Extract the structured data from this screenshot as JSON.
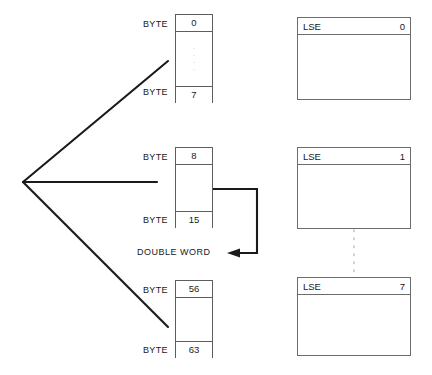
{
  "diagram": {
    "colors": {
      "line": "#1a1a1a",
      "box_border": "#5d5d5d",
      "lse_border": "#6b6b6b",
      "dotted": "#c4c4c4",
      "text": "#1a1a1a",
      "background": "#ffffff"
    },
    "byte_label": "BYTE",
    "lse_label": "LSE",
    "double_word_label": "DOUBLE WORD",
    "vertical_ellipsis": "·",
    "byte_groups": [
      {
        "name": "byte-group-0-7",
        "start": "0",
        "end": "7",
        "has_ellipsis": true
      },
      {
        "name": "byte-group-8-15",
        "start": "8",
        "end": "15",
        "has_ellipsis": false
      },
      {
        "name": "byte-group-56-63",
        "start": "56",
        "end": "63",
        "has_ellipsis": false
      }
    ],
    "lse_blocks": [
      {
        "name": "lse-block-0",
        "label": "LSE",
        "index": "0"
      },
      {
        "name": "lse-block-1",
        "label": "LSE",
        "index": "1"
      },
      {
        "name": "lse-block-7",
        "label": "LSE",
        "index": "7"
      }
    ]
  }
}
